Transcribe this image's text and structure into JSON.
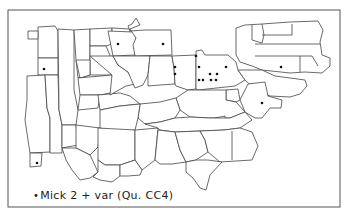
{
  "map": {
    "title": "",
    "legend": {
      "symbol": "•",
      "label": "Mick 2 + var  (Qu. CC4)"
    },
    "dots": [
      {
        "x": 118,
        "y": 44
      },
      {
        "x": 163,
        "y": 44
      },
      {
        "x": 44,
        "y": 69
      },
      {
        "x": 37,
        "y": 163
      },
      {
        "x": 196,
        "y": 56
      },
      {
        "x": 175,
        "y": 67
      },
      {
        "x": 175,
        "y": 74
      },
      {
        "x": 199,
        "y": 67
      },
      {
        "x": 226,
        "y": 67
      },
      {
        "x": 210,
        "y": 74
      },
      {
        "x": 217,
        "y": 74
      },
      {
        "x": 199,
        "y": 80
      },
      {
        "x": 203,
        "y": 80
      },
      {
        "x": 211,
        "y": 80
      },
      {
        "x": 216,
        "y": 80
      },
      {
        "x": 281,
        "y": 67
      },
      {
        "x": 262,
        "y": 103
      }
    ]
  }
}
